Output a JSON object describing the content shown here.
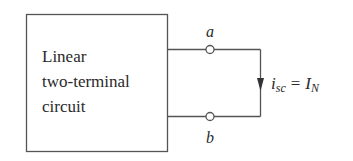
{
  "diagram": {
    "block": {
      "lines": [
        "Linear",
        "two-terminal",
        "circuit"
      ]
    },
    "terminals": {
      "a": "a",
      "b": "b"
    },
    "current_label": {
      "var": "i",
      "var_sub": "sc",
      "equals": "=",
      "rhs": "I",
      "rhs_sub": "N"
    },
    "colors": {
      "line": "#555555",
      "text": "#2a2a2a"
    }
  }
}
